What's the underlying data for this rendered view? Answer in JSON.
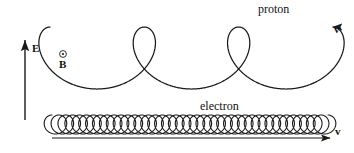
{
  "figure": {
    "type": "physics-trajectory-diagram",
    "background_color": "#ffffff",
    "line_color": "#1a1a1a",
    "labels": {
      "proton": "proton",
      "electron": "electron",
      "electric_field": "E",
      "magnetic_field": "B",
      "velocity_proton": "v",
      "velocity_electron": "v"
    },
    "field_symbols": {
      "magnetic_field_glyph": "circle-dot-out-of-page",
      "electric_field_direction": "up"
    },
    "proton_path": {
      "kind": "prolate-cycloid",
      "loops": 3,
      "x_start": 50,
      "x_end": 333,
      "baseline_y": 27,
      "loop_depth": 62,
      "arrow": "right"
    },
    "electron_path": {
      "kind": "tight-prolate-cycloid",
      "loops": 40,
      "x_start": 52,
      "x_end": 328,
      "baseline_y": 134,
      "loop_depth": 19,
      "arrow": "right"
    }
  }
}
